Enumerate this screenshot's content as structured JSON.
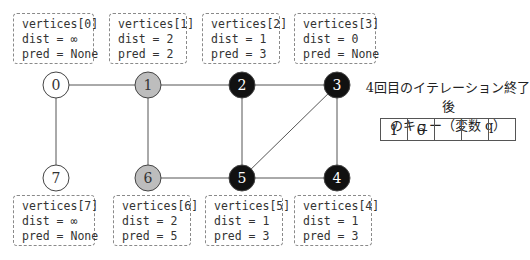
{
  "vertices": [
    {
      "id": "0",
      "title": "vertices[0]",
      "dist": "dist = ∞",
      "pred": "pred = None",
      "state": "unvisited"
    },
    {
      "id": "1",
      "title": "vertices[1]",
      "dist": "dist = 2",
      "pred": "pred = 2",
      "state": "queued"
    },
    {
      "id": "2",
      "title": "vertices[2]",
      "dist": "dist = 1",
      "pred": "pred = 3",
      "state": "visited"
    },
    {
      "id": "3",
      "title": "vertices[3]",
      "dist": "dist = 0",
      "pred": "pred = None",
      "state": "visited"
    },
    {
      "id": "4",
      "title": "vertices[4]",
      "dist": "dist = 1",
      "pred": "pred = 3",
      "state": "visited"
    },
    {
      "id": "5",
      "title": "vertices[5]",
      "dist": "dist = 1",
      "pred": "pred = 3",
      "state": "visited"
    },
    {
      "id": "6",
      "title": "vertices[6]",
      "dist": "dist = 2",
      "pred": "pred = 5",
      "state": "queued"
    },
    {
      "id": "7",
      "title": "vertices[7]",
      "dist": "dist = ∞",
      "pred": "pred = None",
      "state": "unvisited"
    }
  ],
  "edges": [
    [
      "0",
      "1"
    ],
    [
      "1",
      "2"
    ],
    [
      "2",
      "3"
    ],
    [
      "0",
      "7"
    ],
    [
      "1",
      "6"
    ],
    [
      "2",
      "5"
    ],
    [
      "3",
      "5"
    ],
    [
      "3",
      "4"
    ],
    [
      "6",
      "5"
    ],
    [
      "5",
      "4"
    ]
  ],
  "colors": {
    "unvisited": "#ffffff",
    "queued": "#bdbdbd",
    "visited": "#111111",
    "edge": "#555555"
  },
  "queue": {
    "title_line1": "4回目のイテレーション終了後",
    "title_line2": "のキュー（変数 q）",
    "cells": [
      "1",
      "6",
      "",
      "",
      ""
    ]
  }
}
